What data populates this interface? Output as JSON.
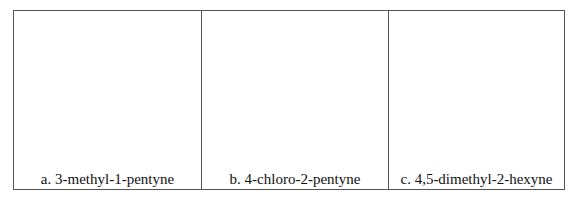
{
  "table": {
    "cells": [
      {
        "label": "a. 3-methyl-1-pentyne"
      },
      {
        "label": "b. 4-chloro-2-pentyne"
      },
      {
        "label": "c. 4,5-dimethyl-2-hexyne"
      }
    ]
  }
}
